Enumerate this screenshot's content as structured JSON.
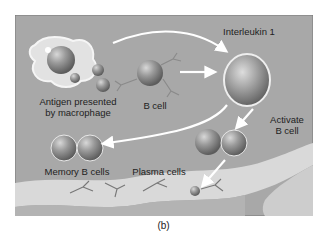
{
  "figure": {
    "caption": "(b)",
    "labels": {
      "interleukin": "Interleukin 1",
      "activate_line1": "Activate",
      "activate_line2": "B cell",
      "b_cell": "B cell",
      "antigen_line1": "Antigen presented",
      "antigen_line2": "by macrophage",
      "memory": "Memory B cells",
      "plasma": "Plasma cells"
    },
    "colors": {
      "background": "#a9a9a9",
      "vessel": "#d9d9d9",
      "cell": "#8c8c8c",
      "arrow": "#ffffff"
    }
  }
}
